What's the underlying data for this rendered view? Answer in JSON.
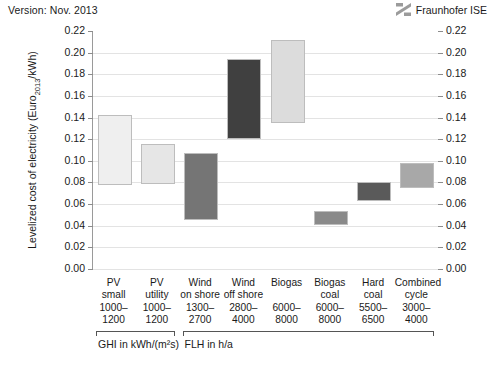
{
  "header": {
    "version_text": "Version: Nov. 2013",
    "brand_name": "Fraunhofer ISE",
    "brand_icon": "fraunhofer-logo-icon"
  },
  "axis": {
    "y_title_main": "Levelized cost of electricity (Euro",
    "y_title_sub": "2013",
    "y_title_tail": "/kWh)",
    "y_ticks": [
      "0.22",
      "0.20",
      "0.18",
      "0.16",
      "0.14",
      "0.12",
      "0.10",
      "0.08",
      "0.06",
      "0.04",
      "0.02",
      "0.00"
    ]
  },
  "groups": [
    {
      "label": "GHI in kWh/(m²s)",
      "from": 0,
      "to": 1
    },
    {
      "label": "FLH in h/a",
      "from": 2,
      "to": 7
    }
  ],
  "chart_data": {
    "type": "bar",
    "subtype": "floating-range-bar",
    "title": "",
    "xlabel": "",
    "ylabel": "Levelized cost of electricity (Euro2013/kWh)",
    "ylim": [
      0.0,
      0.22
    ],
    "ytick_step": 0.02,
    "grid": true,
    "legend": "none",
    "categories": [
      "PV small",
      "PV utility",
      "Wind on shore",
      "Wind off shore",
      "Biogas",
      "Biogas coal",
      "Hard coal",
      "Combined cycle"
    ],
    "category_lines": [
      [
        "PV",
        "small",
        "1000–",
        "1200"
      ],
      [
        "PV",
        "utility",
        "1000–",
        "1200"
      ],
      [
        "Wind",
        "on shore",
        "1300–",
        "2700"
      ],
      [
        "Wind",
        "off shore",
        "2800–",
        "4000"
      ],
      [
        "Biogas",
        "",
        "6000–",
        "8000"
      ],
      [
        "Biogas",
        "coal",
        "6000–",
        "8000"
      ],
      [
        "Hard",
        "coal",
        "5500–",
        "6500"
      ],
      [
        "Combined",
        "cycle",
        "3000–",
        "4000"
      ]
    ],
    "parameter_ranges": [
      "1000–1200",
      "1000–1200",
      "1300–2700",
      "2800–4000",
      "6000–8000",
      "6000–8000",
      "5500–6500",
      "3000–4000"
    ],
    "series": [
      {
        "name": "LCOE range (Euro2013/kWh)",
        "low": [
          0.078,
          0.079,
          0.045,
          0.12,
          0.135,
          0.041,
          0.063,
          0.075
        ],
        "high": [
          0.142,
          0.116,
          0.107,
          0.194,
          0.212,
          0.054,
          0.08,
          0.098
        ]
      }
    ],
    "bar_colors": [
      "#efefef",
      "#e6e6e6",
      "#757575",
      "#404040",
      "#dcdcdc",
      "#8a8a8a",
      "#5a5a5a",
      "#a8a8a8"
    ],
    "bar_border_color": "#bdbdbd"
  }
}
